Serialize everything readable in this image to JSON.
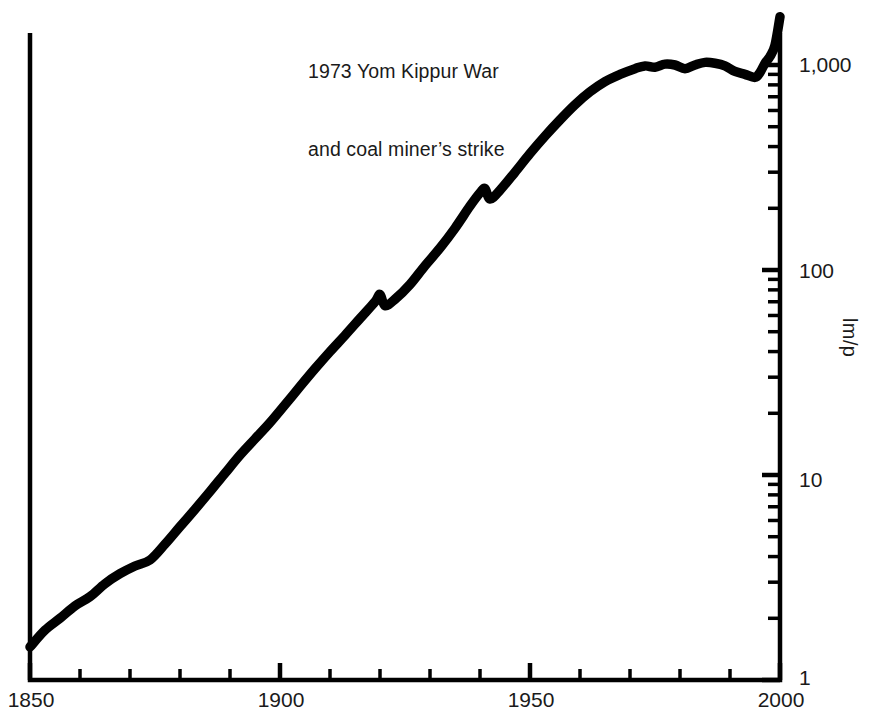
{
  "chart_data": {
    "type": "line",
    "title": "",
    "subtitle": "",
    "xlabel": "",
    "ylabel": "lm/p",
    "annotations": [
      {
        "name": "yom-kippur-note",
        "line1": "1973 Yom Kippur War",
        "line2": "and coal miner’s strike"
      }
    ],
    "xlim": [
      1850,
      2000
    ],
    "ylim": [
      1,
      2000
    ],
    "yscale": "log",
    "xscale": "linear",
    "grid": false,
    "legend": null,
    "x_ticks_major": [
      1850,
      1900,
      1950,
      2000
    ],
    "x_tick_labels": [
      "1850",
      "1900",
      "1950",
      "2000"
    ],
    "x_ticks_minor_step": 10,
    "y_ticks_major": [
      1,
      10,
      100,
      1000
    ],
    "y_tick_labels": [
      "1",
      "10",
      "100",
      "1,000"
    ],
    "series": [
      {
        "name": "lumens per pound",
        "x": [
          1850,
          1853,
          1856,
          1859,
          1862,
          1865,
          1868,
          1871,
          1874,
          1877,
          1880,
          1883,
          1886,
          1889,
          1892,
          1895,
          1898,
          1901,
          1904,
          1907,
          1910,
          1913,
          1916,
          1919,
          1920,
          1921,
          1923,
          1926,
          1929,
          1932,
          1935,
          1938,
          1940,
          1941,
          1942,
          1944,
          1947,
          1950,
          1953,
          1956,
          1959,
          1962,
          1965,
          1968,
          1971,
          1973,
          1975,
          1977,
          1979,
          1981,
          1983,
          1985,
          1987,
          1989,
          1991,
          1993,
          1995,
          1996,
          1997,
          1998,
          1999,
          2000
        ],
        "y": [
          1.45,
          1.75,
          2.0,
          2.3,
          2.55,
          2.95,
          3.3,
          3.6,
          3.85,
          4.6,
          5.6,
          6.8,
          8.3,
          10.2,
          12.5,
          15.0,
          18.0,
          22.0,
          27.0,
          33.0,
          40.0,
          48.0,
          58.0,
          70.0,
          76.0,
          67.0,
          72.0,
          85.0,
          105.0,
          128.0,
          160.0,
          205.0,
          238.0,
          250.0,
          222.0,
          245.0,
          300.0,
          370.0,
          450.0,
          540.0,
          640.0,
          740.0,
          830.0,
          900.0,
          960.0,
          990.0,
          975.0,
          1010.0,
          1000.0,
          960.0,
          1000.0,
          1030.0,
          1020.0,
          990.0,
          930.0,
          900.0,
          870.0,
          920.0,
          1020.0,
          1100.0,
          1250.0,
          1720.0
        ]
      }
    ]
  },
  "axes": {
    "y_label_rotated": "lm/p",
    "y_labels": [
      {
        "value": 1000,
        "text": "1,000"
      },
      {
        "value": 100,
        "text": "100"
      },
      {
        "value": 10,
        "text": "10"
      },
      {
        "value": 1,
        "text": "1"
      }
    ],
    "x_labels": [
      {
        "value": 1850,
        "text": "1850"
      },
      {
        "value": 1900,
        "text": "1900"
      },
      {
        "value": 1950,
        "text": "1950"
      },
      {
        "value": 2000,
        "text": "2000"
      }
    ]
  },
  "note": {
    "line1": "1973 Yom Kippur War",
    "line2": "and coal miner’s strike"
  },
  "colors": {
    "line": "#000000",
    "axis": "#000000",
    "text": "#1a1a1a",
    "background": "#ffffff"
  }
}
